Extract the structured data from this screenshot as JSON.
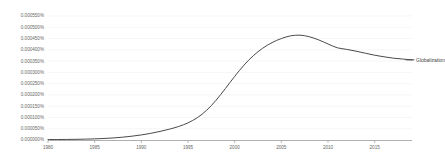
{
  "chart_data": {
    "type": "line",
    "title": "",
    "subtitle": "",
    "xlabel": "",
    "ylabel": "",
    "grid": true,
    "legend_position": "right-inline",
    "xlim": [
      1980,
      2019
    ],
    "ylim": [
      0.0,
      0.00055
    ],
    "xticks": [
      "1980",
      "1985",
      "1990",
      "1995",
      "2000",
      "2005",
      "2010",
      "2015"
    ],
    "xtick_values": [
      1980,
      1985,
      1990,
      1995,
      2000,
      2005,
      2010,
      2015
    ],
    "yticks": [
      "0.000550%",
      "0.000500%",
      "0.000450%",
      "0.000400%",
      "0.000350%",
      "0.000300%",
      "0.000250%",
      "0.000200%",
      "0.000150%",
      "0.000100%",
      "0.000050%",
      "0.000000%"
    ],
    "ytick_values": [
      0.00055,
      0.0005,
      0.00045,
      0.0004,
      0.00035,
      0.0003,
      0.00025,
      0.0002,
      0.00015,
      0.0001,
      5e-05,
      0.0
    ],
    "series": [
      {
        "name": "Globalization",
        "color": "#4a4a4a",
        "x": [
          1980,
          1981,
          1982,
          1983,
          1984,
          1985,
          1986,
          1987,
          1988,
          1989,
          1990,
          1991,
          1992,
          1993,
          1994,
          1995,
          1996,
          1997,
          1998,
          1999,
          2000,
          2001,
          2002,
          2003,
          2004,
          2005,
          2006,
          2007,
          2008,
          2009,
          2010,
          2011,
          2012,
          2013,
          2014,
          2015,
          2016,
          2017,
          2018,
          2019
        ],
        "values": [
          2e-06,
          2.2e-06,
          2.5e-06,
          3e-06,
          3.8e-06,
          5e-06,
          6.8e-06,
          9.2e-06,
          1.25e-05,
          1.7e-05,
          2.25e-05,
          2.95e-05,
          3.8e-05,
          4.8e-05,
          6e-05,
          7.6e-05,
          9.9e-05,
          0.000132,
          0.000176,
          0.000228,
          0.000282,
          0.000332,
          0.000374,
          0.000407,
          0.000432,
          0.00045,
          0.000462,
          0.000465,
          0.000458,
          0.000444,
          0.000426,
          0.000409,
          0.000402,
          0.000394,
          0.000385,
          0.000376,
          0.000369,
          0.000363,
          0.000359,
          0.0003555
        ]
      }
    ]
  },
  "legend": {
    "entries": [
      {
        "label": "Globalization",
        "color": "#4a4a4a"
      }
    ]
  },
  "axes": {
    "y_labels": [
      "0.000550%",
      "0.000500%",
      "0.000450%",
      "0.000400%",
      "0.000350%",
      "0.000300%",
      "0.000250%",
      "0.000200%",
      "0.000150%",
      "0.000100%",
      "0.000050%",
      "0.000000%"
    ],
    "x_labels": [
      "1980",
      "1985",
      "1990",
      "1995",
      "2000",
      "2005",
      "2010",
      "2015"
    ]
  }
}
